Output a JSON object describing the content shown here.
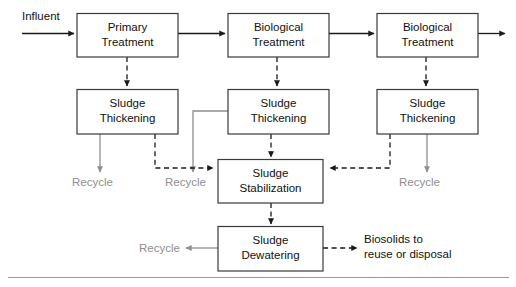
{
  "diagram": {
    "colors": {
      "box_border": "#3a3a3a",
      "box_fill": "#ffffff",
      "solid_flow": "#1a1a1a",
      "dashed_flow": "#1a1a1a",
      "recycle_flow": "#8e8e8e",
      "recycle_text": "#8e8e8e",
      "text": "#111111",
      "baseline_rule": "#9a9a9a"
    },
    "boxes": [
      {
        "id": "primary-treatment",
        "line1": "Primary",
        "line2": "Treatment"
      },
      {
        "id": "biological-treatment-1",
        "line1": "Biological",
        "line2": "Treatment"
      },
      {
        "id": "biological-treatment-2",
        "line1": "Biological",
        "line2": "Treatment"
      },
      {
        "id": "sludge-thickening-1",
        "line1": "Sludge",
        "line2": "Thickening"
      },
      {
        "id": "sludge-thickening-2",
        "line1": "Sludge",
        "line2": "Thickening"
      },
      {
        "id": "sludge-thickening-3",
        "line1": "Sludge",
        "line2": "Thickening"
      },
      {
        "id": "sludge-stabilization",
        "line1": "Sludge",
        "line2": "Stabilization"
      },
      {
        "id": "sludge-dewatering",
        "line1": "Sludge",
        "line2": "Dewatering"
      }
    ],
    "labels": {
      "influent": "Influent",
      "recycle_1": "Recycle",
      "recycle_2": "Recycle",
      "recycle_3": "Recycle",
      "recycle_4": "Recycle",
      "biosolids_line1": "Biosolids to",
      "biosolids_line2": "reuse or disposal"
    }
  }
}
